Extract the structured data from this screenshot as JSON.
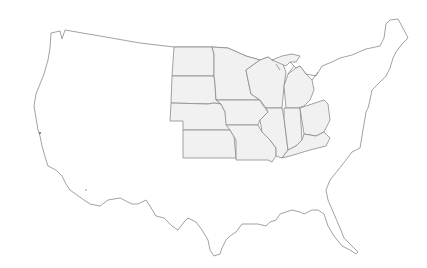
{
  "map": {
    "title": "",
    "type": "outline map",
    "country": "United States (contiguous)",
    "highlighted_region": "Midwest",
    "highlighted_states": [
      "North Dakota",
      "South Dakota",
      "Nebraska",
      "Kansas",
      "Minnesota",
      "Iowa",
      "Missouri",
      "Wisconsin",
      "Illinois",
      "Michigan",
      "Indiana",
      "Ohio",
      "Kentucky"
    ],
    "colors": {
      "background": "#ffffff",
      "land": "#ffffff",
      "highlight_fill": "#f1f1f1",
      "stroke": "#8a8a8a"
    }
  }
}
